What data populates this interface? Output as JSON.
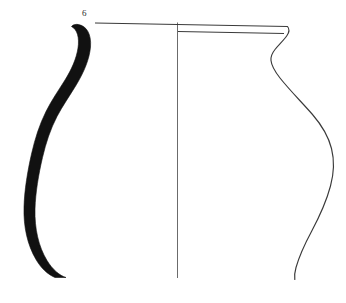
{
  "figure": {
    "number_label": "6",
    "caption": "",
    "background_color": "#ffffff",
    "ink_color": "#1a1a1a",
    "line_color": "#3a3a3a",
    "width_px": 346,
    "height_px": 303
  },
  "drawing": {
    "type": "archaeological-vessel-profile",
    "subject": "ceramic jar / pot",
    "view": "half-section half-elevation",
    "elements": [
      {
        "name": "section-profile-fill",
        "description": "solid black S-curved vessel wall section on left side",
        "fill": "#111111"
      },
      {
        "name": "central-axis",
        "description": "thin vertical centre line of the vessel",
        "stroke": "#555555",
        "stroke_width": 0.8
      },
      {
        "name": "rim-line-upper",
        "description": "horizontal line marking the rim top from section to outer rim edge",
        "stroke": "#3a3a3a",
        "stroke_width": 1.1
      },
      {
        "name": "rim-line-lower",
        "description": "horizontal line marking the underside of the rim on elevation half",
        "stroke": "#3a3a3a",
        "stroke_width": 1.0
      },
      {
        "name": "outer-profile",
        "description": "right-hand outer silhouette: everted rim, constricted neck, globular belly, tapering base",
        "stroke": "#3a3a3a",
        "stroke_width": 1.1
      }
    ]
  }
}
